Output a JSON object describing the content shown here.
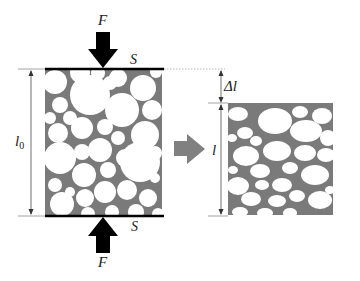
{
  "labels": {
    "force_top": "F",
    "force_bottom": "F",
    "area_top": "S",
    "area_bottom": "S",
    "initial_length": "l",
    "initial_length_sub": "0",
    "final_length": "l",
    "delta_length": "Δl"
  },
  "colors": {
    "background": "#ffffff",
    "matrix_gray": "#7a7a7a",
    "particle_white": "#ffffff",
    "force_arrow": "#000000",
    "transition_arrow": "#808080",
    "dim_line": "#333333",
    "plate": "#000000"
  },
  "specimens": [
    {
      "name": "uncompressed",
      "x": 45,
      "y": 69,
      "width": 117,
      "height": 146
    },
    {
      "name": "compressed",
      "x": 228,
      "y": 103,
      "width": 105,
      "height": 112
    }
  ]
}
